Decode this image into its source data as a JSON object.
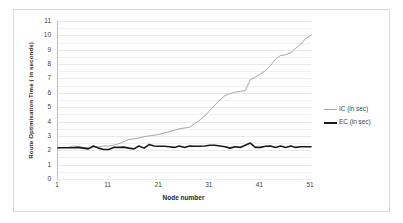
{
  "chart_data": {
    "type": "line",
    "title": "",
    "xlabel": "Node number",
    "ylabel": "Route Optimisation Time ( in seconds)",
    "xlim": [
      1,
      51
    ],
    "ylim": [
      0,
      11
    ],
    "xticks": [
      1,
      11,
      21,
      31,
      41,
      51
    ],
    "yticks": [
      0,
      1,
      2,
      3,
      4,
      5,
      6,
      7,
      8,
      9,
      10,
      11
    ],
    "grid": true,
    "grid_minor_step": 0.5,
    "legend_position": "right",
    "x": [
      1,
      2,
      3,
      4,
      5,
      6,
      7,
      8,
      9,
      10,
      11,
      12,
      13,
      14,
      15,
      16,
      17,
      18,
      19,
      20,
      21,
      22,
      23,
      24,
      25,
      26,
      27,
      28,
      29,
      30,
      31,
      32,
      33,
      34,
      35,
      36,
      37,
      38,
      39,
      40,
      41,
      42,
      43,
      44,
      45,
      46,
      47,
      48,
      49,
      50,
      51
    ],
    "series": [
      {
        "name": "IC (in sec)",
        "color": "#a6a6a6",
        "width": 1.0,
        "values": [
          2.15,
          2.18,
          2.2,
          2.3,
          2.25,
          2.2,
          2.18,
          2.22,
          2.25,
          2.3,
          2.3,
          2.35,
          2.45,
          2.6,
          2.75,
          2.8,
          2.85,
          2.95,
          3.0,
          3.05,
          3.1,
          3.2,
          3.3,
          3.4,
          3.5,
          3.55,
          3.6,
          3.85,
          4.1,
          4.4,
          4.75,
          5.15,
          5.5,
          5.8,
          5.95,
          6.05,
          6.1,
          6.15,
          6.9,
          7.1,
          7.3,
          7.55,
          7.9,
          8.35,
          8.6,
          8.65,
          8.8,
          9.1,
          9.4,
          9.8,
          10.0
        ]
      },
      {
        "name": "EC (in sec)",
        "color": "#1a1a1a",
        "width": 1.6,
        "values": [
          2.18,
          2.18,
          2.18,
          2.18,
          2.2,
          2.15,
          2.1,
          2.3,
          2.15,
          2.05,
          2.05,
          2.2,
          2.2,
          2.22,
          2.15,
          2.1,
          2.3,
          2.15,
          2.4,
          2.3,
          2.28,
          2.28,
          2.25,
          2.2,
          2.3,
          2.2,
          2.3,
          2.28,
          2.28,
          2.3,
          2.35,
          2.35,
          2.3,
          2.25,
          2.15,
          2.25,
          2.2,
          2.35,
          2.5,
          2.2,
          2.2,
          2.28,
          2.3,
          2.2,
          2.3,
          2.2,
          2.3,
          2.2,
          2.25,
          2.25,
          2.25
        ]
      }
    ]
  },
  "legend": {
    "items": [
      {
        "label": "IC (in sec)",
        "color": "#a6a6a6",
        "width": 1.2
      },
      {
        "label": "EC (in sec)",
        "color": "#1a1a1a",
        "width": 2.2
      }
    ]
  },
  "axes": {
    "y_title": "Route Optimisation Time ( in seconds)",
    "x_title": "Node number"
  }
}
